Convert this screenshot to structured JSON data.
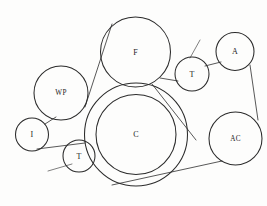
{
  "diagram": {
    "background_color": "#fdfdfc",
    "line_color": "#2b2b2b",
    "belt_color": "#3a3a3a",
    "width": 267,
    "height": 206
  },
  "pulleys": [
    {
      "id": "fan",
      "label": "F",
      "name": "fan-pulley",
      "cx": 135.5,
      "cy": 52,
      "r": 35,
      "double_ring": false,
      "label_dx": 0,
      "label_dy": 0
    },
    {
      "id": "water-pump",
      "label": "WP",
      "name": "water-pump-pulley",
      "cx": 61,
      "cy": 93,
      "r": 27,
      "double_ring": false,
      "label_dx": 0,
      "label_dy": 0
    },
    {
      "id": "idler",
      "label": "I",
      "name": "idler-pulley",
      "cx": 32,
      "cy": 134.5,
      "r": 16.5,
      "double_ring": false,
      "label_dx": 0,
      "label_dy": 0
    },
    {
      "id": "tensioner-lower",
      "label": "T",
      "name": "tensioner-pulley-lower",
      "cx": 79,
      "cy": 156,
      "r": 16,
      "double_ring": false,
      "label_dx": 0,
      "label_dy": 0
    },
    {
      "id": "crankshaft",
      "label": "C",
      "name": "crankshaft-pulley",
      "cx": 136,
      "cy": 134.5,
      "r": 51.5,
      "inner_r": 40,
      "double_ring": true,
      "label_dx": 0,
      "label_dy": 0
    },
    {
      "id": "tensioner-upper",
      "label": "T",
      "name": "tensioner-pulley-upper",
      "cx": 192,
      "cy": 74,
      "r": 17,
      "double_ring": false,
      "label_dx": 0,
      "label_dy": 0
    },
    {
      "id": "alternator",
      "label": "A",
      "name": "alternator-pulley",
      "cx": 235,
      "cy": 51.5,
      "r": 19,
      "double_ring": false,
      "label_dx": 0,
      "label_dy": 0
    },
    {
      "id": "ac-compressor",
      "label": "AC",
      "name": "ac-compressor-pulley",
      "cx": 235.5,
      "cy": 138.5,
      "r": 26.5,
      "double_ring": false,
      "label_dx": 0,
      "label_dy": 0
    }
  ],
  "belt_segments": [
    {
      "name": "belt-wp-to-f",
      "x1": 85,
      "y1": 107,
      "x2": 112,
      "y2": 24
    },
    {
      "name": "belt-wp-to-idler",
      "x1": 45,
      "y1": 124,
      "x2": 56,
      "y2": 117
    },
    {
      "name": "belt-idler-to-tensioner",
      "x1": 37,
      "y1": 149,
      "x2": 85,
      "y2": 143
    },
    {
      "name": "belt-f-to-tensioner-upper",
      "x1": 160,
      "y1": 78,
      "x2": 178,
      "y2": 81
    },
    {
      "name": "belt-tensioner-upper-to-alternator",
      "x1": 205,
      "y1": 66,
      "x2": 221,
      "y2": 62
    },
    {
      "name": "belt-alternator-to-ac",
      "x1": 250,
      "y1": 65,
      "x2": 258,
      "y2": 120
    },
    {
      "name": "belt-ac-to-crank",
      "x1": 222,
      "y1": 161,
      "x2": 112,
      "y2": 185
    },
    {
      "name": "belt-f-down-to-crank",
      "x1": 152,
      "y1": 84,
      "x2": 196,
      "y2": 140
    }
  ],
  "arms": [
    {
      "name": "tensioner-arm-lower",
      "x1": 72,
      "y1": 164,
      "x2": 48,
      "y2": 171
    },
    {
      "name": "tensioner-arm-upper",
      "x1": 190,
      "y1": 58,
      "x2": 200,
      "y2": 40
    }
  ],
  "legend": {
    "F": "Fan",
    "WP": "Water pump",
    "I": "Idler",
    "T": "Tensioner",
    "C": "Crankshaft",
    "A": "Alternator",
    "AC": "Air conditioning compressor"
  }
}
